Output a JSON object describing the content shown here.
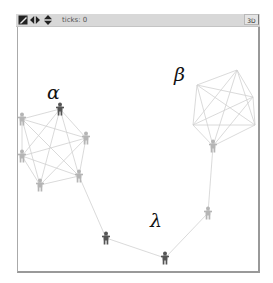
{
  "toolbar": {
    "icons": [
      {
        "name": "edit-icon",
        "glyph": "◪"
      },
      {
        "name": "horizontal-resize-icon",
        "glyph": "◀▶"
      },
      {
        "name": "vertical-resize-icon",
        "glyph": "▲▼"
      }
    ],
    "ticks_label": "ticks: 0",
    "three_d_label": "3D"
  },
  "world": {
    "labels": {
      "alpha": "α",
      "beta": "β",
      "lambda": "λ"
    },
    "colors": {
      "node_dark": "#555555",
      "node_light": "#b5b5b5",
      "link": "#d0d0d0",
      "border": "#999999"
    },
    "clusters": {
      "alpha": {
        "label": "α",
        "nodes": [
          {
            "x": 60,
            "y": 109,
            "shade": "dark"
          },
          {
            "x": 22,
            "y": 119,
            "shade": "light"
          },
          {
            "x": 86,
            "y": 138,
            "shade": "light"
          },
          {
            "x": 22,
            "y": 156,
            "shade": "light"
          },
          {
            "x": 79,
            "y": 176,
            "shade": "light"
          },
          {
            "x": 40,
            "y": 185,
            "shade": "light"
          }
        ]
      },
      "beta": {
        "label": "β",
        "vertices": [
          {
            "x": 237,
            "y": 70
          },
          {
            "x": 253,
            "y": 97
          },
          {
            "x": 255,
            "y": 125
          },
          {
            "x": 213,
            "y": 146
          },
          {
            "x": 193,
            "y": 125
          },
          {
            "x": 197,
            "y": 85
          }
        ],
        "node": {
          "x": 213,
          "y": 146,
          "shade": "light"
        }
      },
      "lambda": {
        "label": "λ",
        "path": [
          {
            "x": 213,
            "y": 146
          },
          {
            "x": 208,
            "y": 213,
            "shade": "light"
          },
          {
            "x": 165,
            "y": 258,
            "shade": "dark"
          },
          {
            "x": 106,
            "y": 238,
            "shade": "dark"
          },
          {
            "x": 79,
            "y": 176
          }
        ]
      }
    }
  }
}
